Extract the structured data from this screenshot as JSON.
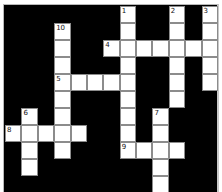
{
  "puzzle": {
    "type": "crossword",
    "cols": 13,
    "rows": 12,
    "colors": {
      "block": "#000000",
      "cell": "#ffffff",
      "cell_border": "#8c8c8c",
      "frame": "#c8c8c8"
    },
    "cells": [
      {
        "r": 0,
        "c": 7,
        "n": "1"
      },
      {
        "r": 0,
        "c": 10,
        "n": "2"
      },
      {
        "r": 0,
        "c": 12,
        "n": "3"
      },
      {
        "r": 1,
        "c": 3,
        "n": "10"
      },
      {
        "r": 1,
        "c": 7
      },
      {
        "r": 1,
        "c": 10
      },
      {
        "r": 1,
        "c": 12
      },
      {
        "r": 2,
        "c": 3
      },
      {
        "r": 2,
        "c": 6,
        "n": "4"
      },
      {
        "r": 2,
        "c": 7
      },
      {
        "r": 2,
        "c": 8
      },
      {
        "r": 2,
        "c": 9
      },
      {
        "r": 2,
        "c": 10
      },
      {
        "r": 2,
        "c": 11
      },
      {
        "r": 2,
        "c": 12
      },
      {
        "r": 3,
        "c": 3
      },
      {
        "r": 3,
        "c": 7
      },
      {
        "r": 3,
        "c": 10
      },
      {
        "r": 3,
        "c": 12
      },
      {
        "r": 4,
        "c": 3,
        "n": "5"
      },
      {
        "r": 4,
        "c": 4
      },
      {
        "r": 4,
        "c": 5
      },
      {
        "r": 4,
        "c": 6
      },
      {
        "r": 4,
        "c": 7
      },
      {
        "r": 4,
        "c": 10
      },
      {
        "r": 4,
        "c": 12
      },
      {
        "r": 5,
        "c": 3
      },
      {
        "r": 5,
        "c": 7
      },
      {
        "r": 5,
        "c": 10
      },
      {
        "r": 6,
        "c": 1,
        "n": "6"
      },
      {
        "r": 6,
        "c": 3
      },
      {
        "r": 6,
        "c": 7
      },
      {
        "r": 6,
        "c": 9,
        "n": "7"
      },
      {
        "r": 7,
        "c": 0,
        "n": "8"
      },
      {
        "r": 7,
        "c": 1
      },
      {
        "r": 7,
        "c": 2
      },
      {
        "r": 7,
        "c": 3
      },
      {
        "r": 7,
        "c": 4
      },
      {
        "r": 7,
        "c": 7
      },
      {
        "r": 7,
        "c": 9
      },
      {
        "r": 8,
        "c": 1
      },
      {
        "r": 8,
        "c": 3
      },
      {
        "r": 8,
        "c": 7,
        "n": "9"
      },
      {
        "r": 8,
        "c": 8
      },
      {
        "r": 8,
        "c": 9
      },
      {
        "r": 8,
        "c": 10
      },
      {
        "r": 9,
        "c": 1
      },
      {
        "r": 9,
        "c": 9
      },
      {
        "r": 10,
        "c": 9
      },
      {
        "r": 11,
        "c": 9
      }
    ],
    "clue_numbers": [
      "1",
      "2",
      "3",
      "4",
      "5",
      "6",
      "7",
      "8",
      "9",
      "10"
    ],
    "entries": {
      "across": [
        {
          "n": "4",
          "row": 2,
          "col": 6,
          "length": 7
        },
        {
          "n": "5",
          "row": 4,
          "col": 3,
          "length": 5
        },
        {
          "n": "8",
          "row": 7,
          "col": 0,
          "length": 5
        },
        {
          "n": "9",
          "row": 8,
          "col": 7,
          "length": 4
        }
      ],
      "down": [
        {
          "n": "1",
          "row": 0,
          "col": 7,
          "length": 9
        },
        {
          "n": "2",
          "row": 0,
          "col": 10,
          "length": 6
        },
        {
          "n": "3",
          "row": 0,
          "col": 12,
          "length": 5
        },
        {
          "n": "6",
          "row": 6,
          "col": 1,
          "length": 4
        },
        {
          "n": "7",
          "row": 6,
          "col": 9,
          "length": 6
        },
        {
          "n": "10",
          "row": 1,
          "col": 3,
          "length": 8
        }
      ]
    }
  }
}
